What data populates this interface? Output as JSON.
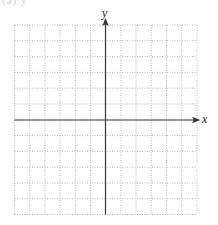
{
  "figure": {
    "header_fragment": "(a) y",
    "type": "coordinate-plane",
    "grid": {
      "columns": 12,
      "rows": 12,
      "style": "dotted",
      "color": "#b5b5b5"
    },
    "axes": {
      "x_label": "x",
      "y_label": "y",
      "color": "#333333",
      "origin_column": 6,
      "origin_row": 6
    }
  }
}
